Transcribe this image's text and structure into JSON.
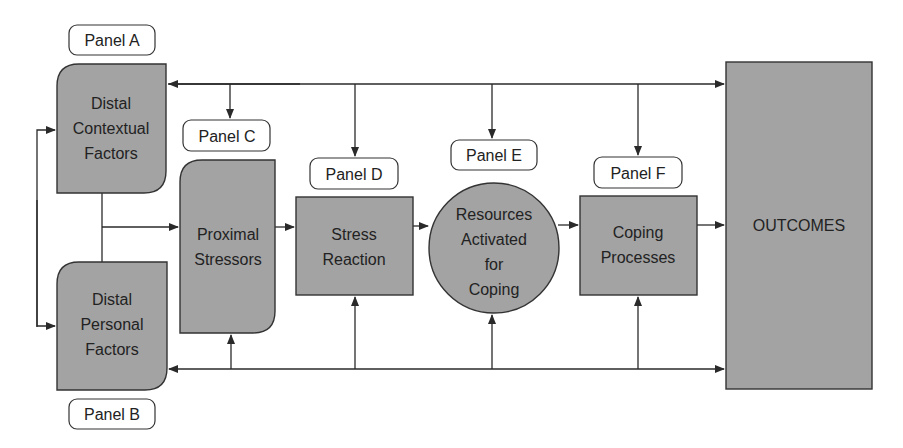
{
  "diagram": {
    "colors": {
      "node_fill": "#a3a3a3",
      "stroke": "#333333",
      "background": "#ffffff"
    },
    "panels": {
      "a": {
        "label": "Panel A",
        "lines": [
          "Distal",
          "Contextual",
          "Factors"
        ]
      },
      "b": {
        "label": "Panel B",
        "lines": [
          "Distal",
          "Personal",
          "Factors"
        ]
      },
      "c": {
        "label": "Panel C",
        "lines": [
          "Proximal",
          "Stressors"
        ]
      },
      "d": {
        "label": "Panel D",
        "lines": [
          "Stress",
          "Reaction"
        ]
      },
      "e": {
        "label": "Panel E",
        "lines": [
          "Resources",
          "Activated",
          "for",
          "Coping"
        ]
      },
      "f": {
        "label": "Panel F",
        "lines": [
          "Coping",
          "Processes"
        ]
      }
    },
    "outcomes": {
      "label": "OUTCOMES"
    },
    "edges": [
      {
        "from": "a",
        "to": "b",
        "type": "bidirectional-left-loop"
      },
      {
        "from": "a+b",
        "to": "c"
      },
      {
        "from": "c",
        "to": "d"
      },
      {
        "from": "d",
        "to": "e"
      },
      {
        "from": "e",
        "to": "f"
      },
      {
        "from": "f",
        "to": "outcomes"
      },
      {
        "from": "top-bus",
        "to": [
          "a",
          "c",
          "d",
          "e",
          "f",
          "outcomes"
        ]
      },
      {
        "from": "bottom-bus",
        "to": [
          "b",
          "c",
          "d",
          "e",
          "f",
          "outcomes"
        ]
      }
    ]
  }
}
